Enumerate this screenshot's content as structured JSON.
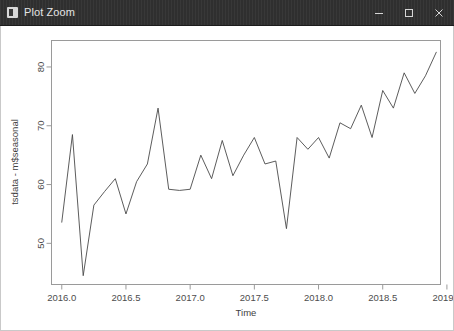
{
  "window": {
    "title": "Plot Zoom",
    "icon": "app-icon",
    "controls": {
      "minimize": "−",
      "maximize": "□",
      "close": "×"
    }
  },
  "chart_data": {
    "type": "line",
    "title": "",
    "subtitle": "",
    "xlabel": "Time",
    "ylabel": "tsdata - m$seasonal",
    "grid": false,
    "legend": false,
    "xlim": [
      2015.92,
      2018.95
    ],
    "ylim": [
      43.0,
      84.5
    ],
    "xticks": [
      2016.0,
      2016.5,
      2017.0,
      2017.5,
      2018.0,
      2018.5,
      2019.0
    ],
    "xticklabels": [
      "2016.0",
      "2016.5",
      "2017.0",
      "2017.5",
      "2018.0",
      "2018.5",
      "2019.0"
    ],
    "yticks": [
      50,
      60,
      70,
      80
    ],
    "yticklabels": [
      "50",
      "60",
      "70",
      "80"
    ],
    "series": [
      {
        "name": "tsdata - m$seasonal",
        "color": "#4a4a4a",
        "x": [
          2016.0,
          2016.083,
          2016.167,
          2016.25,
          2016.333,
          2016.417,
          2016.5,
          2016.583,
          2016.667,
          2016.75,
          2016.833,
          2016.917,
          2017.0,
          2017.083,
          2017.167,
          2017.25,
          2017.333,
          2017.417,
          2017.5,
          2017.583,
          2017.667,
          2017.75,
          2017.833,
          2017.917,
          2018.0,
          2018.083,
          2018.167,
          2018.25,
          2018.333,
          2018.417,
          2018.5,
          2018.583,
          2018.667,
          2018.75,
          2018.833,
          2018.917
        ],
        "y": [
          53.6,
          68.5,
          44.5,
          56.5,
          58.8,
          61.0,
          55.0,
          60.5,
          63.5,
          73.0,
          59.2,
          59.0,
          59.2,
          65.0,
          61.0,
          67.5,
          61.5,
          65.0,
          68.0,
          63.5,
          64.0,
          52.5,
          68.0,
          66.0,
          68.0,
          64.5,
          70.5,
          69.5,
          73.5,
          68.0,
          76.0,
          73.0,
          79.0,
          75.5,
          78.5,
          82.5
        ]
      }
    ]
  }
}
